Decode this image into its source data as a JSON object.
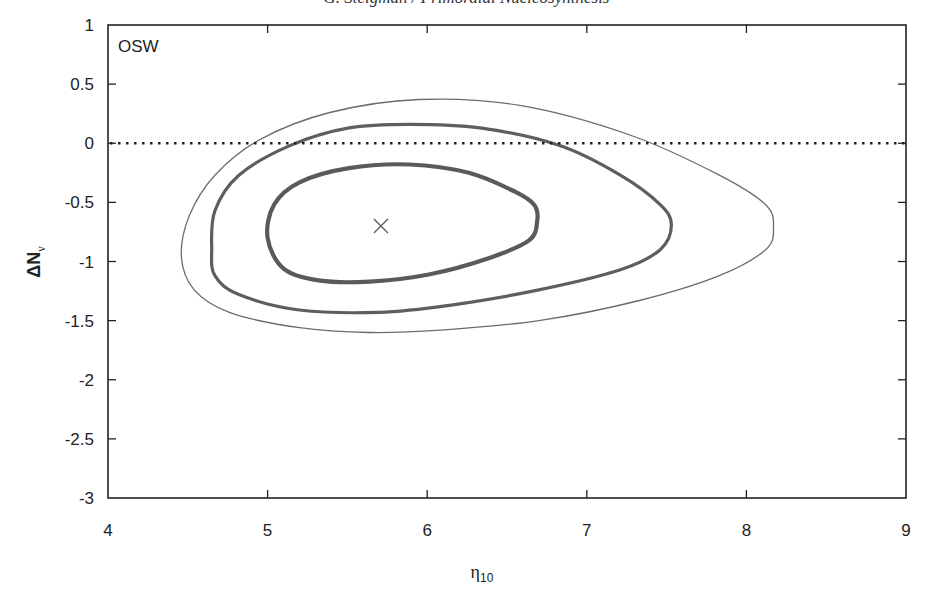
{
  "page": {
    "running_head": "G. Steigman / Primordial Nucleosynthesis"
  },
  "chart_data": {
    "type": "line",
    "subtype": "contour",
    "title": "",
    "panel_label": "OSW",
    "xlabel": "η10",
    "xlabel_main": "η",
    "xlabel_sub": "10",
    "ylabel": "ΔNν",
    "ylabel_main": "ΔN",
    "ylabel_sub": "ν",
    "xlim": [
      4,
      9
    ],
    "ylim": [
      -3,
      1
    ],
    "x_ticks": [
      4,
      5,
      6,
      7,
      8,
      9
    ],
    "x_tick_labels": [
      "4",
      "5",
      "6",
      "7",
      "8",
      "9"
    ],
    "y_ticks": [
      1,
      0.5,
      0,
      -0.5,
      -1,
      -1.5,
      -2,
      -2.5,
      -3
    ],
    "y_tick_labels": [
      "1",
      "0.5",
      "0",
      "-0.5",
      "-1",
      "-1.5",
      "-2",
      "-2.5",
      "-3"
    ],
    "grid": false,
    "legend": null,
    "reference_line": {
      "y": 0,
      "style": "dotted",
      "color": "#222222"
    },
    "best_fit": {
      "x": 5.71,
      "y": -0.7,
      "marker": "x",
      "color": "#666666"
    },
    "series": [
      {
        "name": "outer contour",
        "stroke_width": 1.3,
        "color": "#6b6b6b",
        "x": [
          4.46,
          4.51,
          4.67,
          4.95,
          5.39,
          5.95,
          6.58,
          7.27,
          7.83,
          8.12,
          8.17,
          8.12,
          7.83,
          7.33,
          6.7,
          6.08,
          5.64,
          5.2,
          4.76,
          4.54
        ],
        "y": [
          -0.96,
          -0.61,
          -0.27,
          0.03,
          0.26,
          0.37,
          0.32,
          0.07,
          -0.27,
          -0.52,
          -0.71,
          -0.9,
          -1.12,
          -1.33,
          -1.5,
          -1.58,
          -1.6,
          -1.56,
          -1.43,
          -1.24
        ]
      },
      {
        "name": "middle contour",
        "stroke_width": 3.2,
        "color": "#5e5e5e",
        "x": [
          4.65,
          4.67,
          4.82,
          5.14,
          5.51,
          5.89,
          6.33,
          6.83,
          7.21,
          7.46,
          7.53,
          7.46,
          7.21,
          6.7,
          6.14,
          5.7,
          5.2,
          4.82,
          4.67
        ],
        "y": [
          -0.9,
          -0.57,
          -0.27,
          -0.02,
          0.13,
          0.16,
          0.13,
          -0.02,
          -0.27,
          -0.52,
          -0.69,
          -0.9,
          -1.07,
          -1.24,
          -1.37,
          -1.43,
          -1.41,
          -1.28,
          -1.12
        ]
      },
      {
        "name": "inner contour",
        "stroke_width": 4.2,
        "color": "#5a5a5a",
        "x": [
          5.0,
          5.04,
          5.2,
          5.51,
          5.89,
          6.26,
          6.55,
          6.67,
          6.69,
          6.64,
          6.39,
          6.01,
          5.64,
          5.32,
          5.1
        ],
        "y": [
          -0.8,
          -0.52,
          -0.33,
          -0.21,
          -0.18,
          -0.25,
          -0.41,
          -0.52,
          -0.65,
          -0.82,
          -0.97,
          -1.11,
          -1.17,
          -1.16,
          -1.06
        ]
      }
    ]
  }
}
